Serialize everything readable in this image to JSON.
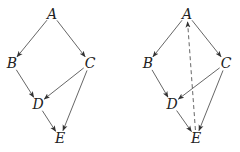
{
  "graphs": [
    {
      "id": "left",
      "nodes": [
        {
          "id": "A",
          "label": "A",
          "x": 52,
          "y": 14
        },
        {
          "id": "B",
          "label": "B",
          "x": 12,
          "y": 63
        },
        {
          "id": "C",
          "label": "C",
          "x": 90,
          "y": 63
        },
        {
          "id": "D",
          "label": "D",
          "x": 38,
          "y": 104
        },
        {
          "id": "E",
          "label": "E",
          "x": 60,
          "y": 138
        }
      ],
      "edges": [
        {
          "from": "A",
          "to": "B",
          "style": "solid"
        },
        {
          "from": "A",
          "to": "C",
          "style": "solid"
        },
        {
          "from": "B",
          "to": "D",
          "style": "solid"
        },
        {
          "from": "C",
          "to": "D",
          "style": "solid"
        },
        {
          "from": "C",
          "to": "E",
          "style": "solid"
        },
        {
          "from": "D",
          "to": "E",
          "style": "solid"
        }
      ]
    },
    {
      "id": "right",
      "nodes": [
        {
          "id": "A",
          "label": "A",
          "x": 187,
          "y": 14
        },
        {
          "id": "B",
          "label": "B",
          "x": 148,
          "y": 63
        },
        {
          "id": "C",
          "label": "C",
          "x": 226,
          "y": 63
        },
        {
          "id": "D",
          "label": "D",
          "x": 172,
          "y": 104
        },
        {
          "id": "E",
          "label": "E",
          "x": 196,
          "y": 138
        }
      ],
      "edges": [
        {
          "from": "A",
          "to": "B",
          "style": "solid"
        },
        {
          "from": "A",
          "to": "C",
          "style": "solid"
        },
        {
          "from": "B",
          "to": "D",
          "style": "solid"
        },
        {
          "from": "C",
          "to": "D",
          "style": "solid"
        },
        {
          "from": "C",
          "to": "E",
          "style": "solid"
        },
        {
          "from": "D",
          "to": "E",
          "style": "solid"
        },
        {
          "from": "E",
          "to": "A",
          "style": "dashed"
        }
      ]
    }
  ],
  "colors": {
    "edge": "#555555",
    "label": "#222222",
    "background": "#ffffff"
  }
}
